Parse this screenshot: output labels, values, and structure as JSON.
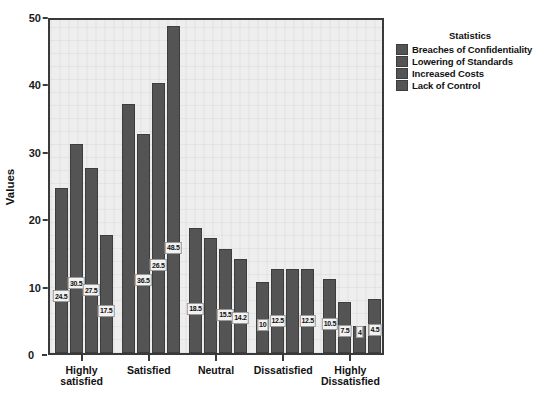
{
  "chart_data": {
    "type": "bar",
    "title": "",
    "xlabel": "",
    "ylabel": "Values",
    "ylim": [
      0,
      50
    ],
    "yticks": [
      0,
      10,
      20,
      30,
      40,
      50
    ],
    "grid": false,
    "legend_position": "right",
    "legend_title": "Statistics",
    "categories": [
      "Highly satisfied",
      "Satisfied",
      "Neutral",
      "Dissatisfied",
      "Highly Dissatisfied"
    ],
    "series": [
      {
        "name": "Breaches of Confidentiality",
        "color": "#545454",
        "values": [
          24.5,
          37,
          18.5,
          10.5,
          11
        ],
        "labels": [
          "24.5",
          "",
          "18.5",
          "10",
          "10.5"
        ]
      },
      {
        "name": "Lowering of Standards",
        "color": "#545454",
        "values": [
          31,
          32.5,
          17,
          12.5,
          7.5
        ],
        "labels": [
          "30.5",
          "36.5",
          "",
          "12.5",
          "7.5"
        ]
      },
      {
        "name": "Increased Costs",
        "color": "#545454",
        "values": [
          27.5,
          40,
          15.5,
          12.5,
          4
        ],
        "labels": [
          "27.5",
          "26.5",
          "15.5",
          "",
          "4"
        ]
      },
      {
        "name": "Lack of Control",
        "color": "#545454",
        "values": [
          17.5,
          48.5,
          14,
          12.5,
          8
        ],
        "labels": [
          "17.5",
          "48.5",
          "14.2",
          "12.5",
          "4.5"
        ]
      }
    ]
  },
  "axes": {
    "y_title": "Values",
    "y_tick_labels": [
      "50",
      "40",
      "30",
      "20",
      "10"
    ],
    "zero_label": "0"
  },
  "legend": {
    "title": "Statistics",
    "items": [
      "Breaches of Confidentiality",
      "Lowering of Standards",
      "Increased Costs",
      "Lack of Control"
    ]
  }
}
